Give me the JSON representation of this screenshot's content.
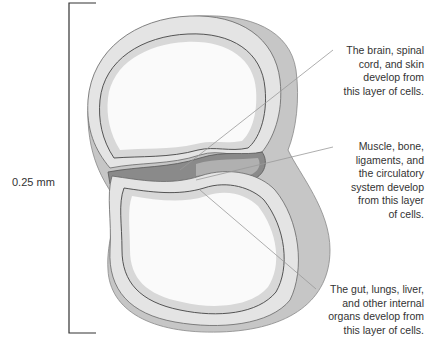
{
  "scale": {
    "label": "0.25 mm"
  },
  "labels": {
    "ectoderm": [
      "The brain, spinal",
      "cord, and skin",
      "develop from",
      "this layer of cells."
    ],
    "mesoderm": [
      "Muscle, bone,",
      "ligaments, and",
      "the circulatory",
      "system develop",
      "from this layer",
      "of cells."
    ],
    "endoderm": [
      "The gut, lungs, liver,",
      "and other internal",
      "organs develop from",
      "this layer of cells."
    ]
  },
  "colors": {
    "outer_layer": "#c9c9c9",
    "middle_layer": "#e3e3e3",
    "inner_fill": "#f7f7f7",
    "mesoderm_dark": "#7a7a7a",
    "outline": "#555555",
    "leader_line": "#999999"
  }
}
